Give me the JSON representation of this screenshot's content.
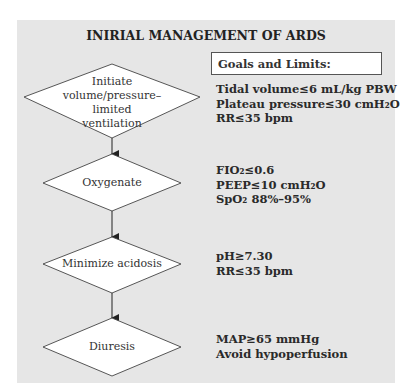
{
  "title": "INIRIAL MANAGEMENT OF ARDS",
  "goals_header": "Goals and Limits:",
  "colors": {
    "panel": "#e6e6e6",
    "diamond_fill": "#ffffff",
    "stroke": "#444444"
  },
  "steps": [
    {
      "label_lines": [
        "Initiate",
        "volume/pressure–limited",
        "ventilation"
      ],
      "notes": [
        "Tidal volume≤6 mL/kg PBW",
        "Plateau pressure≤30 cmH₂O",
        "RR≤35 bpm"
      ]
    },
    {
      "label_lines": [
        "Oxygenate"
      ],
      "notes": [
        "FIO₂≤0.6",
        "PEEP≤10 cmH₂O",
        "SpO₂ 88%–95%"
      ]
    },
    {
      "label_lines": [
        "Minimize acidosis"
      ],
      "notes": [
        "pH≥7.30",
        "RR≤35 bpm"
      ]
    },
    {
      "label_lines": [
        "Diuresis"
      ],
      "notes": [
        "MAP≥65 mmHg",
        "Avoid hypoperfusion"
      ]
    }
  ]
}
